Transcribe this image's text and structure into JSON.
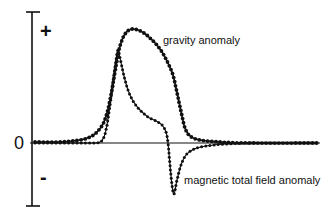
{
  "chart_data": {
    "type": "line",
    "title": "",
    "xlabel": "",
    "ylabel": "",
    "y_tick_labels": [
      "+",
      "0",
      "-"
    ],
    "grid": false,
    "legend": "inline labels",
    "series": [
      {
        "name": "gravity anomaly",
        "marker": "dot",
        "points": [
          [
            35,
            142
          ],
          [
            60,
            142
          ],
          [
            80,
            140
          ],
          [
            90,
            137
          ],
          [
            97,
            132
          ],
          [
            103,
            124
          ],
          [
            107,
            113
          ],
          [
            110,
            100
          ],
          [
            113,
            84
          ],
          [
            116,
            66
          ],
          [
            119,
            50
          ],
          [
            122,
            40
          ],
          [
            125,
            34
          ],
          [
            129,
            30
          ],
          [
            133,
            29
          ],
          [
            138,
            30
          ],
          [
            144,
            33
          ],
          [
            150,
            38
          ],
          [
            156,
            44
          ],
          [
            162,
            52
          ],
          [
            168,
            63
          ],
          [
            173,
            75
          ],
          [
            176,
            88
          ],
          [
            179,
            102
          ],
          [
            182,
            116
          ],
          [
            185,
            128
          ],
          [
            190,
            136
          ],
          [
            200,
            140
          ],
          [
            220,
            142
          ],
          [
            250,
            143
          ],
          [
            318,
            143
          ]
        ]
      },
      {
        "name": "magnetic total field anomaly",
        "marker": "dot",
        "points": [
          [
            35,
            143
          ],
          [
            90,
            143
          ],
          [
            100,
            142
          ],
          [
            104,
            137
          ],
          [
            107,
            125
          ],
          [
            110,
            105
          ],
          [
            113,
            82
          ],
          [
            116,
            60
          ],
          [
            118,
            50
          ],
          [
            120,
            58
          ],
          [
            124,
            76
          ],
          [
            128,
            90
          ],
          [
            133,
            101
          ],
          [
            140,
            110
          ],
          [
            148,
            117
          ],
          [
            156,
            121
          ],
          [
            162,
            125
          ],
          [
            166,
            132
          ],
          [
            168,
            143
          ],
          [
            170,
            165
          ],
          [
            172,
            185
          ],
          [
            174,
            194
          ],
          [
            177,
            180
          ],
          [
            181,
            165
          ],
          [
            186,
            155
          ],
          [
            194,
            149
          ],
          [
            206,
            146
          ],
          [
            225,
            144
          ],
          [
            260,
            143
          ],
          [
            318,
            143
          ]
        ]
      }
    ]
  },
  "labels": {
    "plus": "+",
    "zero": "0",
    "minus": "-",
    "gravity": "gravity anomaly",
    "magnetic": "magnetic total field anomaly"
  }
}
